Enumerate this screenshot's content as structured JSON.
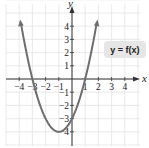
{
  "chart_data": {
    "type": "line",
    "title": "",
    "xlabel": "x",
    "ylabel": "y",
    "xlim": [
      -4.5,
      5
    ],
    "ylim": [
      -4.8,
      5
    ],
    "grid": true,
    "x_ticks": [
      -4,
      -3,
      -2,
      -1,
      1,
      2,
      3,
      4
    ],
    "y_ticks": [
      -4,
      -3,
      -2,
      -1,
      1,
      2,
      3,
      4
    ],
    "x_tick_labels": [
      "−4",
      "−3",
      "−2",
      "−1",
      "1",
      "2",
      "3",
      "4"
    ],
    "y_tick_labels": [
      "−4",
      "−3",
      "−2",
      "−1",
      "1",
      "2",
      "3",
      "4"
    ],
    "series": [
      {
        "name": "y = f(x)",
        "equation": "y = x^2 + 2x - 3",
        "color": "#6e6e6e",
        "x": [
          -4,
          -3.5,
          -3,
          -2,
          -1,
          0,
          1,
          1.5,
          2
        ],
        "values": [
          5,
          2.25,
          0,
          -3,
          -4,
          -3,
          0,
          2.25,
          5
        ]
      }
    ],
    "key_points": {
      "vertex": [
        -1,
        -4
      ],
      "x_intercepts": [
        -3,
        1
      ],
      "y_intercept": -3
    },
    "annotations": [
      "y = f(x)"
    ]
  },
  "label": "y = f(x)",
  "axis": {
    "x": "x",
    "y": "y"
  }
}
